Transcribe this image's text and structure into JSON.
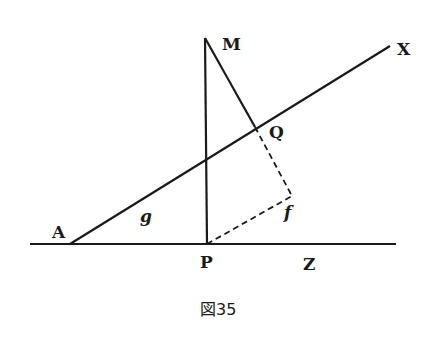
{
  "figure": {
    "caption": "図35",
    "stroke_color": "#1a1a1a",
    "points": {
      "A": {
        "label": "A",
        "x": 70,
        "y": 244
      },
      "P": {
        "label": "P",
        "x": 207,
        "y": 244
      },
      "M": {
        "label": "M",
        "x": 205,
        "y": 38
      },
      "Q": {
        "label": "Q",
        "x": 255,
        "y": 127
      },
      "X": {
        "label": "X",
        "x": 390,
        "y": 46
      },
      "Z": {
        "label": "Z",
        "x": 310,
        "y": 244
      },
      "f": {
        "label": "f",
        "x": 292,
        "y": 196
      }
    },
    "angle_label": "g",
    "lines": [
      {
        "name": "baseline-AZ",
        "style": "solid"
      },
      {
        "name": "line-AX",
        "style": "solid"
      },
      {
        "name": "line-PM",
        "style": "solid"
      },
      {
        "name": "line-MQ",
        "style": "solid"
      },
      {
        "name": "line-Qf",
        "style": "dashed"
      },
      {
        "name": "line-Pf",
        "style": "dashed"
      }
    ]
  }
}
